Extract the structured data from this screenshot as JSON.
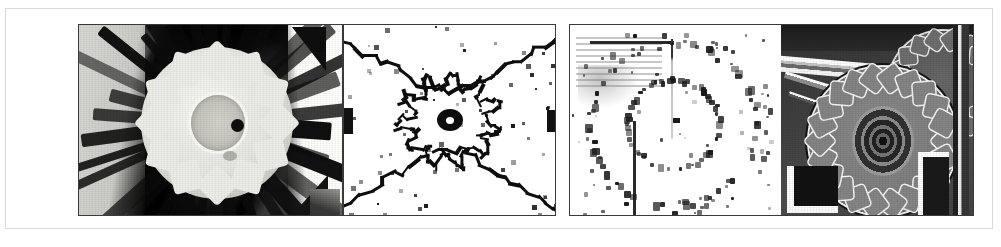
{
  "figure": {
    "type": "image-panel-strip",
    "panel_count": 4,
    "background_color": "#ffffff",
    "frame_border_color": "#d9d9d9",
    "panel_border_color": "#3a3a3a",
    "alt": "Row of four mechanical gear images: grayscale photograph, binary edge map, sparse dot feature map, and high-contrast clockwork photograph"
  },
  "panels": [
    {
      "id": "panel-1",
      "name": "grayscale-gear-photograph",
      "content": "Grayscale photograph of a light spur gear with approximately twelve teeth on a dark mottled background, a bright circular hub ring and a small dark bore hole offset right of centre; pale vertical band at left and a white region with dark triangular wedges at the right.",
      "render_style": "grayscale-photo",
      "dominant_colors": [
        "#cfcfcb",
        "#171717",
        "#e8e8e3",
        "#fbfbf9"
      ]
    },
    {
      "id": "panel-2",
      "name": "binary-edge-map",
      "content": "Black-on-white binary edge image. Jagged one-pixel-wide contours form a large X / bowtie pattern spanning corner to corner, with a ragged gear-tooth outline around the middle and a solid dark ellipse with a white hole at the exact centre.",
      "render_style": "binary-threshold",
      "dominant_colors": [
        "#ffffff",
        "#0d0d0d"
      ]
    },
    {
      "id": "panel-3",
      "name": "sparse-dot-feature-map",
      "content": "White field sprinkled with small black dots tracing two concentric broken circles — an inner ring and a larger outer ring of gear teeth. Horizontal and vertical straight line fragments cross the upper-left quadrant, with a faint striped grey smudge in the top-left corner and a single dot marking the centre.",
      "render_style": "sparse-binary",
      "dominant_colors": [
        "#ffffff",
        "#1a1a1a",
        "#8a8a8a"
      ]
    },
    {
      "id": "panel-4",
      "name": "high-contrast-clockwork-photograph",
      "content": "Dark grey photograph of clockwork: a large bright-outlined spur gear with about twenty teeth and a concentric ridged hub, meshing with a smaller gear at the upper right; bright metal bars run diagonally from the upper-left, with bright L-shaped brackets at lower-left and lower-right.",
      "render_style": "grayscale-photo-high-contrast",
      "dominant_colors": [
        "#3b3b3b",
        "#8c8c8c",
        "#efefef",
        "#1c1c1c"
      ]
    }
  ]
}
